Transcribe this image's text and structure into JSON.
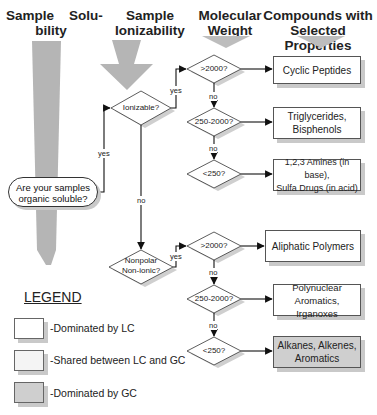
{
  "headers": {
    "solubility": "Sample  Solu-\nbility",
    "solubility_l1": "Sample    Solu-",
    "solubility_l2": "bility",
    "ionizability_l1": "Sample",
    "ionizability_l2": "Ionizability",
    "mw_l1": "Molecular",
    "mw_l2": "Weight",
    "compounds_l1": "Compounds with",
    "compounds_l2": "Selected Properties"
  },
  "start": {
    "line1": "Are your samples",
    "line2": "organic soluble?"
  },
  "decisions": {
    "ionizable": "Ionizable?",
    "nonpolar_l1": "Nonpolar",
    "nonpolar_l2": "Non-ionic?",
    "ion_gt2000": ">2000?",
    "ion_mid": "250-2000?",
    "ion_lt250": "<250?",
    "np_gt2000": ">2000?",
    "np_mid": "250-2000?",
    "np_lt250": "<250?"
  },
  "edges": {
    "yes": "yes",
    "no": "no"
  },
  "results": [
    {
      "l1": "Cyclic Peptides",
      "l2": "",
      "category": "LC"
    },
    {
      "l1": "Triglycerides,",
      "l2": "Bisphenols",
      "category": "LC"
    },
    {
      "l1": "1,2,3 Amines (in base),",
      "l2": "Sulfa Drugs (in acid)",
      "category": "LC"
    },
    {
      "l1": "Aliphatic Polymers",
      "l2": "",
      "category": "LC"
    },
    {
      "l1": "Polynuclear Aromatics,",
      "l2": "Irganoxes",
      "category": "LC"
    },
    {
      "l1": "Alkanes, Alkenes,",
      "l2": "Aromatics",
      "category": "GC"
    }
  ],
  "legend": {
    "title": "LEGEND",
    "items": [
      {
        "label": "-Dominated by LC",
        "color": "#ffffff"
      },
      {
        "label": "-Shared between LC and GC",
        "color": "#f4f4f4"
      },
      {
        "label": "-Dominated by GC",
        "color": "#cfcfcf"
      }
    ]
  },
  "colors": {
    "arrow_fill": "#b5b5b5",
    "shadow": "#c9c9c9",
    "gc_fill": "#cfcfcf",
    "line": "#111111"
  }
}
